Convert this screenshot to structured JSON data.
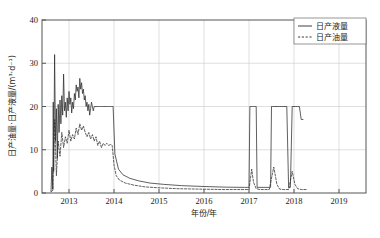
{
  "figure": {
    "caption": "",
    "background": "#ffffff"
  },
  "axis": {
    "x_title": "年份/年",
    "y_title": "日产油量·日产液量/(m³·d⁻¹)",
    "x_ticklabels": [
      "2013",
      "2014",
      "2015",
      "2016",
      "2017",
      "2018",
      "2019"
    ],
    "y_ticklabels": [
      "0",
      "10",
      "20",
      "30",
      "40"
    ]
  },
  "legend": {
    "items": [
      {
        "label": "日产液量",
        "style": "solid",
        "color": "#2b2b2b"
      },
      {
        "label": "日产油量",
        "style": "dashed",
        "color": "#2b2b2b"
      }
    ]
  },
  "chart_data": {
    "type": "line",
    "title": "",
    "xlabel": "年份/年",
    "ylabel": "日产油量·日产液量/(m³·d⁻¹)",
    "xlim": [
      2012.4,
      2019.6
    ],
    "ylim": [
      0,
      40
    ],
    "xticks": [
      2013,
      2014,
      2015,
      2016,
      2017,
      2018,
      2019
    ],
    "yticks": [
      0,
      10,
      20,
      30,
      40
    ],
    "grid": true,
    "legend_position": "top-right",
    "series": [
      {
        "name": "日产液量",
        "style": "solid",
        "color": "#2b2b2b",
        "x": [
          2012.6,
          2012.62,
          2012.64,
          2012.65,
          2012.66,
          2012.68,
          2012.7,
          2012.72,
          2012.74,
          2012.76,
          2012.78,
          2012.8,
          2012.82,
          2012.84,
          2012.86,
          2012.88,
          2012.9,
          2012.92,
          2012.94,
          2012.96,
          2012.98,
          2013.0,
          2013.02,
          2013.04,
          2013.06,
          2013.08,
          2013.1,
          2013.12,
          2013.14,
          2013.16,
          2013.18,
          2013.2,
          2013.22,
          2013.24,
          2013.26,
          2013.28,
          2013.3,
          2013.32,
          2013.34,
          2013.36,
          2013.38,
          2013.4,
          2013.42,
          2013.44,
          2013.46,
          2013.48,
          2013.5,
          2013.52,
          2013.54,
          2013.56,
          2013.58,
          2013.6,
          2013.62,
          2013.64,
          2013.66,
          2013.68,
          2013.7,
          2013.72,
          2013.74,
          2013.76,
          2013.78,
          2013.8,
          2013.82,
          2013.84,
          2013.86,
          2013.88,
          2013.9,
          2013.92,
          2013.94,
          2013.96,
          2013.98,
          2014.02,
          2014.1,
          2014.2,
          2014.35,
          2014.55,
          2014.8,
          2015.1,
          2015.5,
          2016.0,
          2016.5,
          2016.9,
          2016.96,
          2017.0,
          2017.02,
          2017.04,
          2017.06,
          2017.08,
          2017.1,
          2017.12,
          2017.14,
          2017.16,
          2017.18,
          2017.22,
          2017.4,
          2017.48,
          2017.5,
          2017.52,
          2017.56,
          2017.6,
          2017.64,
          2017.68,
          2017.72,
          2017.76,
          2017.8,
          2017.84,
          2017.88,
          2017.92,
          2017.96,
          2018.0,
          2018.04,
          2018.08,
          2018.12,
          2018.16,
          2018.2
        ],
        "y": [
          0.4,
          6.0,
          0.8,
          21.0,
          5.0,
          32.0,
          12.0,
          19.5,
          8.0,
          20.5,
          14.0,
          21.5,
          16.0,
          22.5,
          18.0,
          27.5,
          19.0,
          21.0,
          17.5,
          22.0,
          19.0,
          23.5,
          20.5,
          22.0,
          18.5,
          21.0,
          19.5,
          23.0,
          21.5,
          25.0,
          23.5,
          24.5,
          22.0,
          26.5,
          24.0,
          25.5,
          23.0,
          24.0,
          21.5,
          22.5,
          20.0,
          21.0,
          19.0,
          20.5,
          18.0,
          19.5,
          21.0,
          20.0,
          19.0,
          20.0,
          20.0,
          20.0,
          20.0,
          20.0,
          20.0,
          20.0,
          20.0,
          20.0,
          20.0,
          20.0,
          20.0,
          20.0,
          20.0,
          20.0,
          20.0,
          20.0,
          20.0,
          20.0,
          20.0,
          20.0,
          20.0,
          9.0,
          5.5,
          4.2,
          3.4,
          2.8,
          2.3,
          2.0,
          1.7,
          1.5,
          1.35,
          1.3,
          1.3,
          1.3,
          20.0,
          20.0,
          20.0,
          20.0,
          20.0,
          20.0,
          20.0,
          20.0,
          1.3,
          1.3,
          1.3,
          1.3,
          20.0,
          20.0,
          20.0,
          20.0,
          20.0,
          20.0,
          20.0,
          20.0,
          20.0,
          20.0,
          1.3,
          1.3,
          20.0,
          20.0,
          20.0,
          20.0,
          20.0,
          17.0,
          17.0
        ]
      },
      {
        "name": "日产油量",
        "style": "dashed",
        "color": "#2b2b2b",
        "x": [
          2012.6,
          2012.64,
          2012.68,
          2012.72,
          2012.76,
          2012.8,
          2012.84,
          2012.88,
          2012.92,
          2012.96,
          2013.0,
          2013.04,
          2013.08,
          2013.12,
          2013.16,
          2013.2,
          2013.24,
          2013.28,
          2013.32,
          2013.36,
          2013.4,
          2013.44,
          2013.48,
          2013.52,
          2013.56,
          2013.6,
          2013.64,
          2013.68,
          2013.72,
          2013.76,
          2013.8,
          2013.84,
          2013.88,
          2013.92,
          2013.96,
          2014.0,
          2014.05,
          2014.12,
          2014.25,
          2014.45,
          2014.7,
          2015.0,
          2015.4,
          2015.9,
          2016.4,
          2016.9,
          2017.0,
          2017.06,
          2017.1,
          2017.16,
          2017.24,
          2017.45,
          2017.55,
          2017.62,
          2017.68,
          2017.76,
          2017.88,
          2017.96,
          2018.02,
          2018.08,
          2018.16,
          2018.3
        ],
        "y": [
          0.3,
          0.6,
          17.0,
          4.0,
          12.0,
          8.5,
          14.0,
          10.5,
          13.0,
          11.5,
          14.5,
          12.0,
          13.5,
          12.5,
          15.0,
          13.5,
          16.0,
          14.5,
          15.5,
          14.0,
          13.0,
          14.0,
          12.5,
          13.5,
          12.0,
          13.0,
          11.0,
          12.0,
          10.5,
          11.5,
          11.0,
          11.5,
          11.0,
          11.2,
          11.0,
          6.5,
          4.0,
          3.0,
          2.3,
          1.8,
          1.4,
          1.2,
          1.0,
          0.9,
          0.8,
          0.8,
          0.8,
          5.5,
          2.5,
          1.0,
          0.8,
          0.8,
          6.0,
          2.0,
          0.9,
          0.8,
          0.8,
          5.0,
          2.0,
          1.0,
          0.8,
          0.8
        ]
      }
    ],
    "annotations": [
      {
        "text": "noisy fluctuating production 2012.6–2013.5, liquid 18–32, oil 8–17"
      },
      {
        "text": "plateau at 20 m³/d from 2013.5 to 2014.0"
      },
      {
        "text": "hyperbolic decline 2014–2017 toward ~1.3 baseline"
      },
      {
        "text": "three rectangular workover spikes to 20 m³/d in 2017–2018"
      },
      {
        "text": "one narrow oil spike reaching ~37 m³/d near 2017.9"
      }
    ]
  }
}
